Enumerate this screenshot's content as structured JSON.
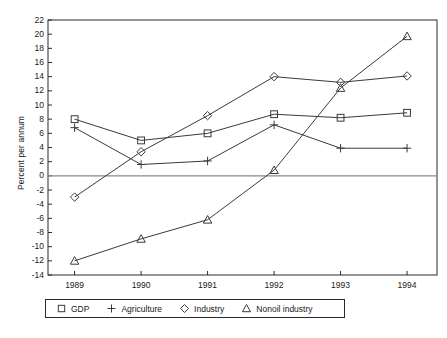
{
  "chart_data": {
    "type": "line",
    "title": "",
    "xlabel": "",
    "ylabel": "Percent per annum",
    "categories": [
      "1989",
      "1990",
      "1991",
      "1992",
      "1993",
      "1994"
    ],
    "x": [
      1989,
      1990,
      1991,
      1992,
      1993,
      1994
    ],
    "xlim": [
      1988.6,
      1994.45
    ],
    "ylim": [
      -14,
      22
    ],
    "ytick_step": 2,
    "yticks": [
      -14,
      -12,
      -10,
      -8,
      -6,
      -4,
      -2,
      0,
      2,
      4,
      6,
      8,
      10,
      12,
      14,
      16,
      18,
      20,
      22
    ],
    "ytick_labels": [
      "-14",
      "-12",
      "-10",
      "-8",
      "-6",
      "-4",
      "-2",
      "0",
      "2",
      "4",
      "6",
      "8",
      "10",
      "12",
      "14",
      "16",
      "18",
      "20",
      "22"
    ],
    "grid": false,
    "zero_line": true,
    "legend_position": "below",
    "series": [
      {
        "name": "GDP",
        "marker": "square",
        "values": [
          8.0,
          5.0,
          6.0,
          8.7,
          8.2,
          8.9
        ]
      },
      {
        "name": "Agriculture",
        "marker": "plus",
        "values": [
          6.8,
          1.6,
          2.1,
          7.2,
          3.9,
          3.9
        ]
      },
      {
        "name": "Industry",
        "marker": "diamond",
        "values": [
          -3.0,
          3.4,
          8.5,
          14.0,
          13.2,
          14.1
        ]
      },
      {
        "name": "Nonoil industry",
        "marker": "triangle",
        "values": [
          -12.0,
          -8.9,
          -6.2,
          0.8,
          12.4,
          19.7
        ]
      }
    ]
  },
  "legend": {
    "items": [
      {
        "label": "GDP",
        "marker": "square"
      },
      {
        "label": "Agriculture",
        "marker": "plus"
      },
      {
        "label": "Industry",
        "marker": "diamond"
      },
      {
        "label": "Nonoil industry",
        "marker": "triangle"
      }
    ]
  },
  "colors": {
    "line": "#3a3a3a",
    "axis": "#2a2a2a",
    "zero_line": "#8a8a8a",
    "text": "#1a1a1a",
    "background": "#ffffff"
  }
}
